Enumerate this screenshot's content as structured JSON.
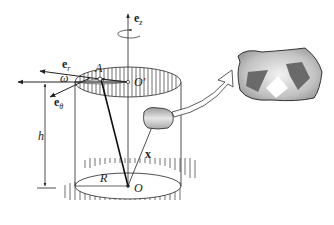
{
  "diagram": {
    "labels": {
      "e_z": {
        "base": "e",
        "sub": "z"
      },
      "e_r": {
        "base": "e",
        "sub": "r"
      },
      "e_theta": {
        "base": "e",
        "sub": "θ"
      },
      "omega": "ω",
      "A": "A",
      "O_prime": "O′",
      "h": "h",
      "x": "x",
      "R": "R",
      "O": "O"
    },
    "colors": {
      "stroke": "#222222",
      "hatch": "#333333",
      "inset_bg": "#b8b8b8",
      "inset_shape": "#6a6a6a",
      "element_fill": "#bdbdbd"
    }
  }
}
